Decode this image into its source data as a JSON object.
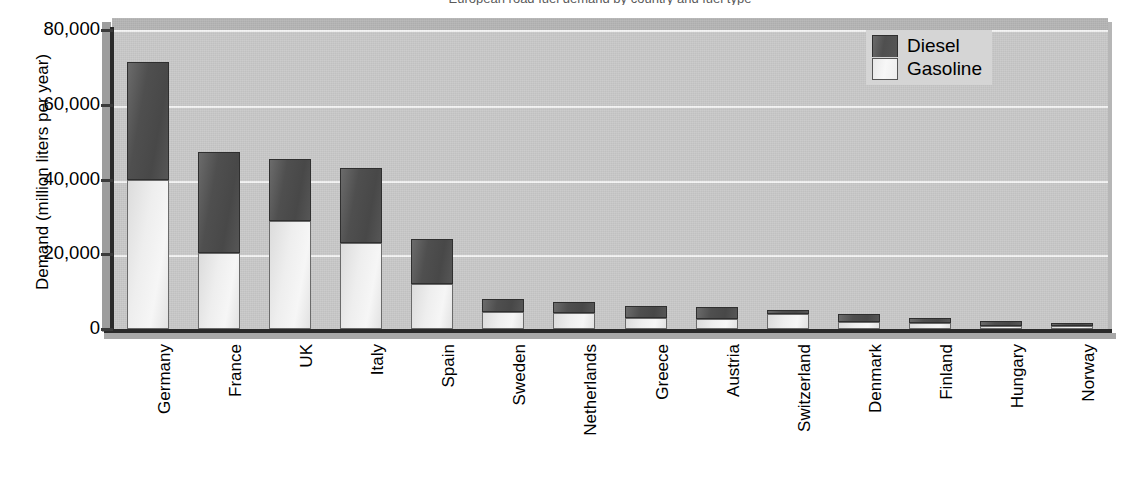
{
  "figure": {
    "title_sliver": "European road fuel demand by country and fuel type",
    "legend_position": "top-right",
    "plot_background": "#c9c9c9",
    "grid": true
  },
  "legend": {
    "items": [
      {
        "label": "Diesel",
        "color": "#4f4f4f",
        "icon": "legend-swatch-diesel"
      },
      {
        "label": "Gasoline",
        "color": "#f0f0f0",
        "icon": "legend-swatch-gasoline"
      }
    ]
  },
  "axes": {
    "ylabel": "Demand (million liters per year)",
    "yticks": [
      "0",
      "20,000",
      "40,000",
      "60,000",
      "80,000"
    ],
    "ytick_values": [
      0,
      20000,
      40000,
      60000,
      80000
    ],
    "ylim": [
      0,
      80000
    ],
    "xlabel": ""
  },
  "chart_data": {
    "type": "bar",
    "stacked": true,
    "title": "European road fuel demand by country and fuel type",
    "xlabel": "",
    "ylabel": "Demand (million liters per year)",
    "ylim": [
      0,
      80000
    ],
    "yticks": [
      0,
      20000,
      40000,
      60000,
      80000
    ],
    "grid": true,
    "legend_position": "top-right",
    "categories": [
      "Germany",
      "France",
      "UK",
      "Italy",
      "Spain",
      "Sweden",
      "Netherlands",
      "Greece",
      "Austria",
      "Switzerland",
      "Denmark",
      "Finland",
      "Hungary",
      "Norway"
    ],
    "series": [
      {
        "name": "Gasoline",
        "color": "#f0f0f0",
        "values": [
          40000,
          20400,
          29000,
          23000,
          12000,
          4600,
          4200,
          3000,
          2600,
          4000,
          2000,
          1700,
          900,
          700
        ]
      },
      {
        "name": "Diesel",
        "color": "#4f4f4f",
        "values": [
          31500,
          27000,
          16500,
          20000,
          12000,
          3300,
          3000,
          3200,
          3300,
          1000,
          2000,
          1300,
          1200,
          900
        ]
      }
    ],
    "totals": [
      71500,
      47400,
      45500,
      43000,
      24000,
      7900,
      7200,
      6200,
      5900,
      5000,
      4000,
      3000,
      2100,
      1600
    ]
  }
}
